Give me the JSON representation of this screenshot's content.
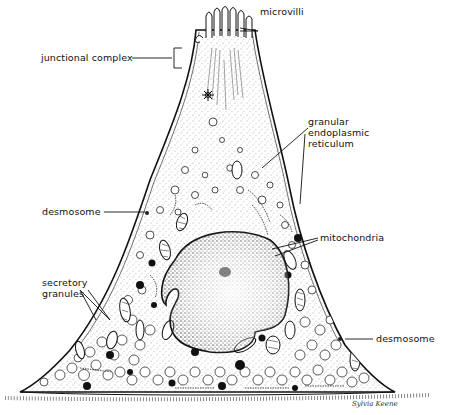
{
  "figure": {
    "type": "anatomical illustration",
    "background": "#ffffff",
    "ink_color": "#111111"
  },
  "labels": {
    "microvilli": "microvilli",
    "junctional_complex": "junctional complex",
    "granular_er_line1": "granular",
    "granular_er_line2": "endoplasmic",
    "granular_er_line3": "reticulum",
    "desmosome_left": "desmosome",
    "mitochondria": "mitochondria",
    "secretory_line1": "secretory",
    "secretory_line2": "granules",
    "desmosome_right": "desmosome"
  },
  "signature": "Sylvia Keene"
}
